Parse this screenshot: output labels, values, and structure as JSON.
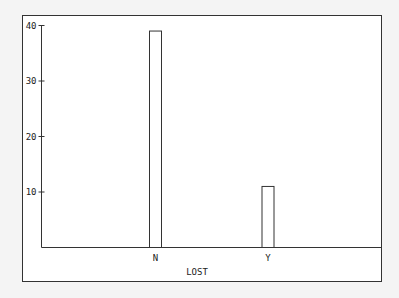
{
  "chart_data": {
    "type": "bar",
    "title": "",
    "xlabel": "LOST",
    "ylabel": "",
    "categories": [
      "N",
      "Y"
    ],
    "values": [
      39,
      11
    ],
    "ylim": [
      0,
      40
    ],
    "yticks": [
      10,
      20,
      30,
      40
    ],
    "grid": false,
    "legend": null
  },
  "colors": {
    "background": "#f4f4f4",
    "plot_background": "#ffffff",
    "frame": "#333333",
    "bar_fill": "#ffffff",
    "bar_stroke": "#333333"
  }
}
